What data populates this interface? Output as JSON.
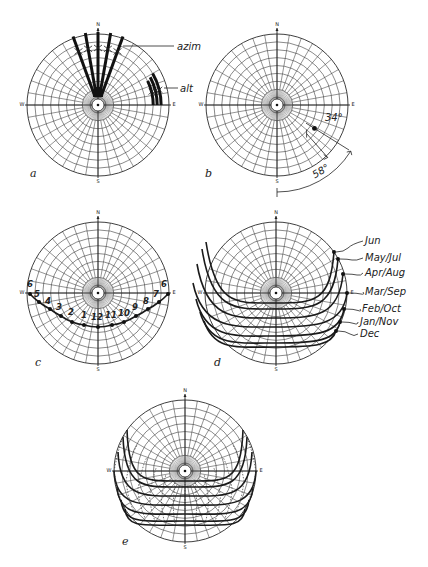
{
  "figure": {
    "caption_visible": false
  },
  "compass": {
    "north": "N",
    "south": "S",
    "east": "E",
    "west": "W"
  },
  "panels": {
    "a": {
      "letter": "a",
      "center": [
        98,
        105
      ],
      "radius": 71,
      "labels": {
        "azimuth": "azim",
        "altitude": "alt"
      },
      "azimuth_lines_deg": [
        -20,
        -10,
        0,
        10,
        20
      ],
      "altitude_arcs": [
        {
          "alt_deg": 10,
          "from_az": 60,
          "to_az": 90
        },
        {
          "alt_deg": 15,
          "from_az": 62,
          "to_az": 90
        },
        {
          "alt_deg": 20,
          "from_az": 64,
          "to_az": 90
        }
      ]
    },
    "b": {
      "letter": "b",
      "center": [
        277,
        105
      ],
      "radius": 71,
      "sun_position": {
        "altitude_deg": 34,
        "azimuth_deg_from_south": 58,
        "direction": "SE"
      },
      "labels": {
        "altitude": "34°",
        "azimuth": "58°"
      }
    },
    "c": {
      "letter": "c",
      "center": [
        98,
        293
      ],
      "radius": 71,
      "hours": [
        {
          "label": "6",
          "pt": [
            30,
            294
          ],
          "lp": [
            30,
            287
          ]
        },
        {
          "label": "5",
          "pt": [
            39,
            302
          ],
          "lp": [
            37,
            297
          ]
        },
        {
          "label": "4",
          "pt": [
            50,
            309
          ],
          "lp": [
            48,
            304
          ]
        },
        {
          "label": "3",
          "pt": [
            61,
            316
          ],
          "lp": [
            59,
            310
          ]
        },
        {
          "label": "2",
          "pt": [
            72,
            322
          ],
          "lp": [
            71,
            315
          ]
        },
        {
          "label": "1",
          "pt": [
            84,
            325
          ],
          "lp": [
            84,
            318
          ]
        },
        {
          "label": "12",
          "pt": [
            98,
            327
          ],
          "lp": [
            97,
            320
          ]
        },
        {
          "label": "11",
          "pt": [
            112,
            325
          ],
          "lp": [
            111,
            318
          ]
        },
        {
          "label": "10",
          "pt": [
            124,
            322
          ],
          "lp": [
            124,
            316
          ]
        },
        {
          "label": "9",
          "pt": [
            136,
            316
          ],
          "lp": [
            135,
            310
          ]
        },
        {
          "label": "8",
          "pt": [
            148,
            309
          ],
          "lp": [
            146,
            304
          ]
        },
        {
          "label": "7",
          "pt": [
            159,
            302
          ],
          "lp": [
            156,
            297
          ]
        },
        {
          "label": "6",
          "pt": [
            168,
            294
          ],
          "lp": [
            164,
            287
          ]
        }
      ]
    },
    "d": {
      "letter": "d",
      "center": [
        276,
        293
      ],
      "radius": 71,
      "months": [
        {
          "label": "Jun",
          "end": [
            334,
            252
          ],
          "noon_y": 303,
          "label_pos": [
            365,
            244
          ]
        },
        {
          "label": "May/Jul",
          "end": [
            338,
            259
          ],
          "noon_y": 309,
          "label_pos": [
            365,
            261
          ]
        },
        {
          "label": "Apr/Aug",
          "end": [
            343,
            274
          ],
          "noon_y": 318,
          "label_pos": [
            365,
            276
          ]
        },
        {
          "label": "Mar/Sep",
          "end": [
            347,
            293
          ],
          "noon_y": 327,
          "label_pos": [
            365,
            295
          ]
        },
        {
          "label": "Feb/Oct",
          "end": [
            344,
            309
          ],
          "noon_y": 336,
          "label_pos": [
            362,
            312
          ]
        },
        {
          "label": "Jan/Nov",
          "end": [
            340,
            322
          ],
          "noon_y": 343,
          "label_pos": [
            360,
            325
          ]
        },
        {
          "label": "Dec",
          "end": [
            336,
            331
          ],
          "noon_y": 347,
          "label_pos": [
            360,
            337
          ]
        }
      ]
    },
    "e": {
      "letter": "e",
      "center": [
        185,
        471
      ],
      "radius": 71,
      "description": "overlay of monthly sun paths with dotted hour lines"
    }
  },
  "chart_data": {
    "type": "polar sun-path diagrams",
    "title": "",
    "grid": {
      "altitude_rings_deg": [
        0,
        10,
        20,
        30,
        40,
        50,
        60,
        70,
        80,
        90
      ],
      "azimuth_spacing_deg": 10
    },
    "panels": [
      "a",
      "b",
      "c",
      "d",
      "e"
    ],
    "b_example": {
      "altitude_deg": 34,
      "azimuth_deg": 58
    },
    "c_hours": [
      "6",
      "5",
      "4",
      "3",
      "2",
      "1",
      "12",
      "11",
      "10",
      "9",
      "8",
      "7",
      "6"
    ],
    "d_months": [
      "Jun",
      "May/Jul",
      "Apr/Aug",
      "Mar/Sep",
      "Feb/Oct",
      "Jan/Nov",
      "Dec"
    ]
  }
}
